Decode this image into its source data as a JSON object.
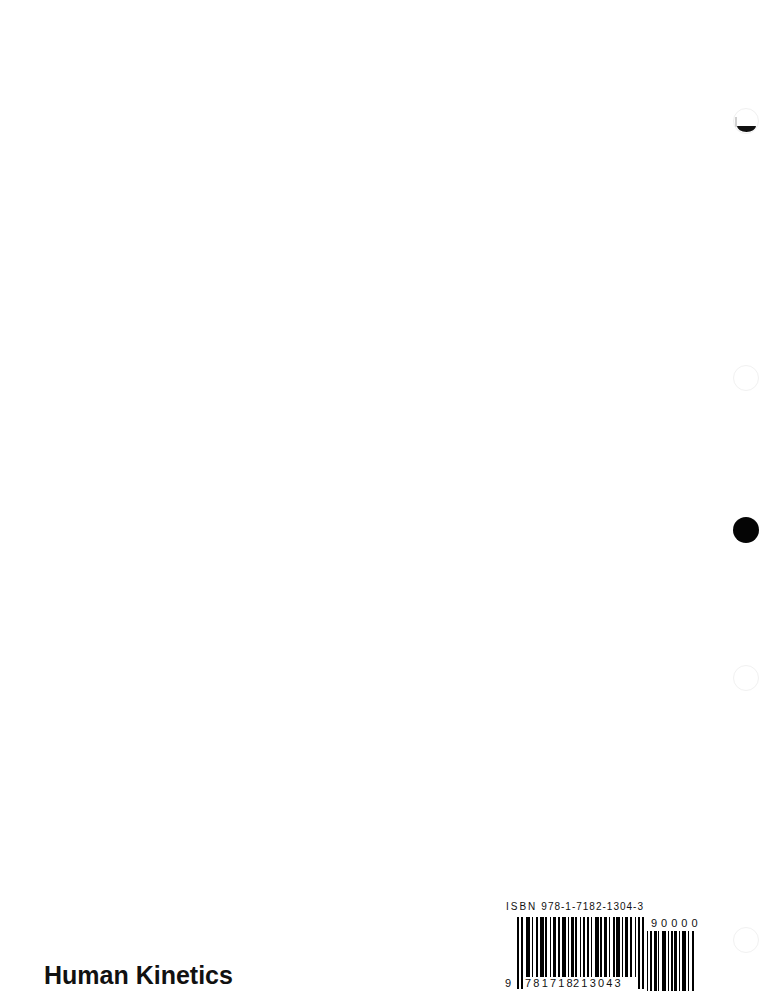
{
  "page": {
    "background": "#ffffff",
    "type": "book back cover (scanned, mostly blank)"
  },
  "publisher": {
    "name": "Human Kinetics"
  },
  "barcode": {
    "isbn_label_prefix": "ISBN",
    "isbn": "978-1-7182-1304-3",
    "ean_lead_digit": "9",
    "ean_left_group": "781718",
    "ean_right_group": "213043",
    "addon_digits": "90000"
  },
  "punch_holes": [
    {
      "position": "right-edge-top",
      "style": "partial-shadow"
    },
    {
      "position": "right-edge-upper-middle",
      "style": "faint-outline"
    },
    {
      "position": "right-edge-middle",
      "style": "solid-black"
    },
    {
      "position": "right-edge-lower-middle",
      "style": "faint-outline"
    },
    {
      "position": "right-edge-bottom",
      "style": "faint-outline"
    }
  ],
  "colors": {
    "ink": "#111111",
    "hole_solid": "#050505",
    "hole_outline": "#f1f1f1"
  }
}
